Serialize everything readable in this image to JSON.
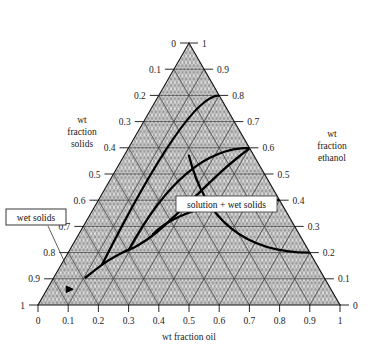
{
  "figure": {
    "type": "ternary-phase-diagram",
    "background": "#ffffff",
    "line_color": "#000000",
    "grid_color": "#4a4a4a",
    "fill_color": "#d8d8d8"
  },
  "axes": {
    "bottom": {
      "title": "wt fraction oil",
      "ticks": [
        "0",
        "0.1",
        "0.2",
        "0.3",
        "0.4",
        "0.5",
        "0.6",
        "0.7",
        "0.8",
        "0.9",
        "1"
      ],
      "values": [
        0,
        0.1,
        0.2,
        0.3,
        0.4,
        0.5,
        0.6,
        0.7,
        0.8,
        0.9,
        1
      ]
    },
    "left": {
      "title_lines": [
        "wt",
        "fraction",
        "solids"
      ],
      "ticks": [
        "0",
        "0.1",
        "0.2",
        "0.3",
        "0.4",
        "0.5",
        "0.6",
        "0.7",
        "0.8",
        "0.9",
        "1"
      ],
      "values": [
        0,
        0.1,
        0.2,
        0.3,
        0.4,
        0.5,
        0.6,
        0.7,
        0.8,
        0.9,
        1
      ]
    },
    "right": {
      "title_lines": [
        "wt",
        "fraction",
        "ethanol"
      ],
      "ticks": [
        "0",
        "0.1",
        "0.2",
        "0.3",
        "0.4",
        "0.5",
        "0.6",
        "0.7",
        "0.8",
        "0.9",
        "1"
      ],
      "values": [
        0,
        0.1,
        0.2,
        0.3,
        0.4,
        0.5,
        0.6,
        0.7,
        0.8,
        0.9,
        1
      ]
    }
  },
  "labels": {
    "wet_solids": "wet solids",
    "solution_wet_solids": "solution + wet solids"
  },
  "chart_data": {
    "type": "line",
    "title": "",
    "xlabel": "wt fraction oil",
    "ylabel": "wt fraction solids",
    "zlabel": "wt fraction ethanol",
    "grid": true,
    "legend": "none",
    "binodal_curve": {
      "name": "phase boundary",
      "points": [
        {
          "oil": 0.105,
          "solids": 0.79,
          "ethanol": 0.105
        },
        {
          "oil": 0.14,
          "solids": 0.7,
          "ethanol": 0.16
        },
        {
          "oil": 0.18,
          "solids": 0.62,
          "ethanol": 0.2
        },
        {
          "oil": 0.215,
          "solids": 0.56,
          "ethanol": 0.225
        },
        {
          "oil": 0.25,
          "solids": 0.48,
          "ethanol": 0.27
        },
        {
          "oil": 0.285,
          "solids": 0.37,
          "ethanol": 0.345
        },
        {
          "oil": 0.32,
          "solids": 0.25,
          "ethanol": 0.43
        },
        {
          "oil": 0.355,
          "solids": 0.13,
          "ethanol": 0.515
        },
        {
          "oil": 0.39,
          "solids": 0.03,
          "ethanol": 0.58
        },
        {
          "oil": 0.402,
          "solids": 0.0,
          "ethanol": 0.598
        }
      ]
    },
    "tie_lines": [
      {
        "name": "tie-line-1",
        "right_axis_value": 0.8,
        "from": {
          "oil": 0.135,
          "solids": 0.71,
          "ethanol": 0.155
        },
        "to": {
          "oil": 0.095,
          "solids": 0.105,
          "ethanol": 0.8
        }
      },
      {
        "name": "tie-line-2",
        "right_axis_value": 0.6,
        "from": {
          "oil": 0.195,
          "solids": 0.595,
          "ethanol": 0.21
        },
        "to": {
          "oil": 0.185,
          "solids": 0.215,
          "ethanol": 0.6
        }
      },
      {
        "name": "tie-line-3",
        "right_axis_value": 0.4,
        "from": {
          "oil": 0.245,
          "solids": 0.485,
          "ethanol": 0.27
        },
        "to": {
          "oil": 0.295,
          "solids": 0.305,
          "ethanol": 0.4
        }
      },
      {
        "name": "tie-line-4",
        "right_axis_value": 0.2,
        "from": {
          "oil": 0.215,
          "solids": 0.215,
          "ethanol": 0.57
        },
        "to": {
          "oil": 0.48,
          "solids": 0.32,
          "ethanol": 0.2
        }
      }
    ],
    "marker": {
      "name": "wet-solids-point",
      "oil": 0.075,
      "solids": 0.865,
      "ethanol": 0.06
    }
  }
}
